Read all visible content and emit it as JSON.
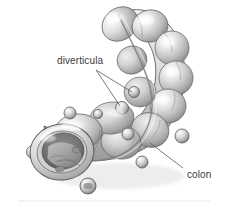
{
  "figure": {
    "style": "grayscale airbrushed medical illustration",
    "background_color": "#ffffff",
    "canvas": {
      "width": 228,
      "height": 210
    }
  },
  "labels": [
    {
      "id": "diverticula",
      "text": "diverticula",
      "color": "#3b3b3b",
      "font_size_px": 10,
      "x": 57,
      "y": 56,
      "leader_lines": 2
    },
    {
      "id": "colon",
      "text": "colon",
      "color": "#3b3b3b",
      "font_size_px": 10,
      "x": 187,
      "y": 170,
      "leader_lines": 1
    }
  ],
  "leaders": {
    "color": "#5a5a5a",
    "width_px": 0.8,
    "diverticula_a": {
      "x1": 96,
      "y1": 70,
      "x2": 120,
      "y2": 106
    },
    "diverticula_b": {
      "x1": 96,
      "y1": 70,
      "x2": 132,
      "y2": 92
    },
    "colon": {
      "x1": 183,
      "y1": 168,
      "x2": 150,
      "y2": 143
    }
  },
  "palette": {
    "tissue_light": "#f2f2f2",
    "tissue_mid": "#c9c9c9",
    "tissue_shadow": "#8e8e8e",
    "tissue_deep": "#6a6a6a",
    "outline": "#5d5d5d",
    "lumen_dark": "#6f6f6f",
    "lumen_deep": "#575757",
    "baseline_rule": "#e3e3e3"
  },
  "anatomy": {
    "haustra_count": 9,
    "taenia_coli": "longitudinal band running along the colon length",
    "cut_away": "open cross-section at lower-left showing lumen and mucosal folds",
    "diverticula_pouches": 8
  },
  "baseline_rule": {
    "y": 201,
    "x1": 18,
    "x2": 210,
    "color": "#e9e9e9"
  }
}
